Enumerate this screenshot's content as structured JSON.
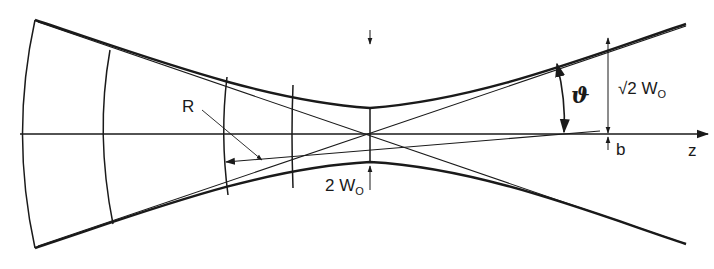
{
  "figure": {
    "type": "gaussian-beam-diagram"
  },
  "labels": {
    "radius_of_curvature": "R",
    "divergence_angle": "ϑ",
    "sqrt2_w0_prefix": "√2",
    "sqrt2_w0_main": "W",
    "sqrt2_w0_sub": "O",
    "waist_prefix": "2",
    "waist_main": "W",
    "waist_sub": "O",
    "confocal_param": "b",
    "axis": "z"
  },
  "colors": {
    "stroke": "#1a1a1a",
    "background": "#ffffff"
  }
}
